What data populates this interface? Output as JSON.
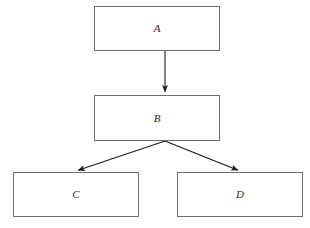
{
  "diagram": {
    "type": "flowchart",
    "background_color": "#ffffff",
    "box_border_color": "#6f6f6f",
    "arrow_color": "#1a1a1a",
    "label_color": "#2b2b2b",
    "nodes": [
      {
        "id": "A",
        "label": "A",
        "x": 94,
        "y": 6,
        "width": 126,
        "height": 45
      },
      {
        "id": "B",
        "label": "B",
        "x": 94,
        "y": 95,
        "width": 126,
        "height": 46
      },
      {
        "id": "C",
        "label": "C",
        "x": 13,
        "y": 172,
        "width": 126,
        "height": 45
      },
      {
        "id": "D",
        "label": "D",
        "x": 177,
        "y": 172,
        "width": 126,
        "height": 45
      }
    ],
    "edges": [
      {
        "id": "A-to-B",
        "from": "A",
        "to": "B",
        "x1": 165,
        "y1": 51,
        "x2": 165,
        "y2": 94
      },
      {
        "id": "B-to-C",
        "from": "B",
        "to": "C",
        "x1": 165,
        "y1": 141,
        "x2": 76,
        "y2": 171
      },
      {
        "id": "B-to-D",
        "from": "B",
        "to": "D",
        "x1": 165,
        "y1": 141,
        "x2": 240,
        "y2": 171
      }
    ]
  }
}
